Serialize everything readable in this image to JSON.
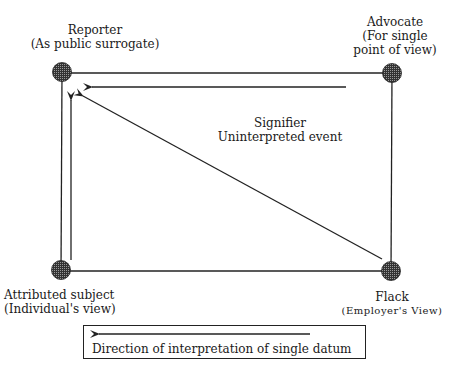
{
  "nodes": {
    "reporter": {
      "title": "Reporter",
      "subtitle": "(As public surrogate)"
    },
    "advocate": {
      "title": "Advocate",
      "line2": "(For single",
      "line3": "point of view)"
    },
    "attributed": {
      "title": "Attributed subject",
      "subtitle": "(Individual's view)"
    },
    "flack": {
      "title": "Flack",
      "subtitle": "(Employer's View)"
    }
  },
  "center": {
    "line1": "Signifier",
    "line2": "Uninterpreted event"
  },
  "legend": {
    "text": "Direction of interpretation of single datum"
  },
  "colors": {
    "line": "#222222",
    "node_fill": "#555555"
  }
}
